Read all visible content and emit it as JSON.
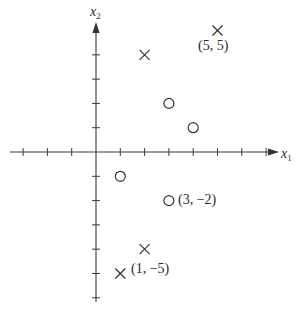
{
  "diagram": {
    "axes": {
      "x_label": "x",
      "x_subscript": "1",
      "y_label": "x",
      "y_subscript": "2",
      "origin_px": [
        96,
        152
      ],
      "unit_px": 24.3,
      "x_ticks": [
        -3,
        -2,
        -1,
        1,
        2,
        3,
        4,
        5,
        6,
        7
      ],
      "y_ticks": [
        -6,
        -5,
        -4,
        -3,
        -2,
        -1,
        1,
        2,
        3,
        4
      ]
    },
    "points": [
      {
        "x": 2,
        "y": 4,
        "marker": "cross",
        "label": ""
      },
      {
        "x": 5,
        "y": 5,
        "marker": "cross",
        "label": "(5, 5)"
      },
      {
        "x": 3,
        "y": 2,
        "marker": "circle",
        "label": ""
      },
      {
        "x": 4,
        "y": 1,
        "marker": "circle",
        "label": ""
      },
      {
        "x": 1,
        "y": -1,
        "marker": "circle",
        "label": ""
      },
      {
        "x": 3,
        "y": -2,
        "marker": "circle",
        "label": "(3, −2)"
      },
      {
        "x": 2,
        "y": -4,
        "marker": "cross",
        "label": ""
      },
      {
        "x": 1,
        "y": -5,
        "marker": "cross",
        "label": "(1, −5)"
      }
    ],
    "labels": {
      "p55": "(5, 5)",
      "p3m2": "(3, −2)",
      "p1m5": "(1, −5)"
    }
  }
}
